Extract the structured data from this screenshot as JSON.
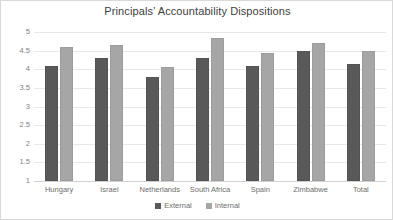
{
  "chart_data": {
    "type": "bar",
    "title": "Principals’ Accountability Dispositions",
    "xlabel": "",
    "ylabel": "",
    "ylim": [
      1,
      5
    ],
    "yticks": [
      5,
      4.5,
      4,
      3.5,
      3,
      2.5,
      2,
      1.5,
      1
    ],
    "ytick_labels": [
      "5",
      "4.5",
      "4",
      "3.5",
      "3",
      "2.5",
      "2",
      "1.5",
      "1"
    ],
    "grid": true,
    "legend_position": "bottom",
    "categories": [
      "Hungary",
      "Israel",
      "Netherlands",
      "South Africa",
      "Spain",
      "Zimbabwe",
      "Total"
    ],
    "series": [
      {
        "name": "External",
        "color": "#595959",
        "values": [
          4.1,
          4.3,
          3.8,
          4.3,
          4.1,
          4.5,
          4.15
        ]
      },
      {
        "name": "Internal",
        "color": "#a6a6a6",
        "values": [
          4.6,
          4.65,
          4.05,
          4.85,
          4.45,
          4.7,
          4.5
        ]
      }
    ]
  },
  "colors": {
    "external": "#595959",
    "internal": "#a6a6a6",
    "gridline": "#e8e8e8",
    "border": "#d9d9d9",
    "text": "#6d6d6d",
    "title": "#404040"
  }
}
